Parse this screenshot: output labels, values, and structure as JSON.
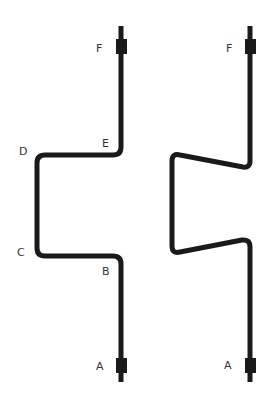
{
  "diagram": {
    "colors": {
      "pipe": "#1a1a1a",
      "label": "#333333",
      "background": "#ffffff"
    },
    "left_pipe": {
      "labels": {
        "A": "A",
        "B": "B",
        "C": "C",
        "D": "D",
        "E": "E",
        "F": "F"
      }
    },
    "right_pipe": {
      "labels": {
        "A": "A",
        "F": "F"
      }
    }
  }
}
